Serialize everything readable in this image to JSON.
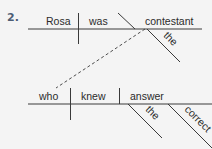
{
  "exercise": {
    "number": "2.",
    "number_color": "#4d5d74"
  },
  "main_clause": {
    "subject": "Rosa",
    "verb": "was",
    "predicate_nominative": "contestant",
    "modifiers": [
      "the"
    ]
  },
  "relative_clause": {
    "subject": "who",
    "verb": "knew",
    "direct_object": "answer",
    "modifiers": [
      "the",
      "correct"
    ]
  },
  "connector": {
    "type": "dashed",
    "from": "contestant",
    "to": "who"
  }
}
